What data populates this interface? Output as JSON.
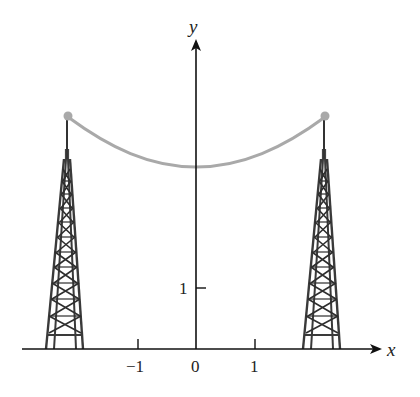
{
  "figure": {
    "axes": {
      "x_label": "x",
      "y_label": "y",
      "x_ticks": [
        {
          "value": -1,
          "label": "−1"
        },
        {
          "value": 0,
          "label": "0"
        },
        {
          "value": 1,
          "label": "1"
        }
      ],
      "y_ticks": [
        {
          "value": 1,
          "label": "1"
        }
      ]
    },
    "cable": {
      "color": "#a9a9a9",
      "description": "catenary curve y = cosh-like, lowest point on y-axis",
      "endpoints": [
        [
          -2.2,
          3.8
        ],
        [
          2.2,
          3.8
        ]
      ],
      "vertex": [
        0,
        3.0
      ]
    },
    "towers": [
      {
        "name": "left-tower",
        "x_center": -2.2
      },
      {
        "name": "right-tower",
        "x_center": 2.2
      }
    ],
    "colors": {
      "axis": "#111111",
      "tower": "#3a3a3a",
      "cable": "#a9a9a9",
      "background": "#ffffff"
    }
  }
}
